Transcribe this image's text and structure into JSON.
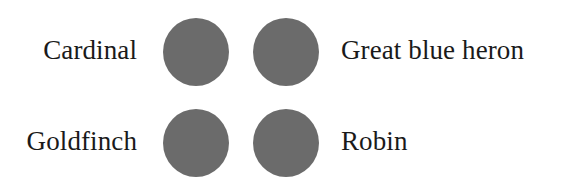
{
  "items": [
    {
      "label": "Cardinal",
      "side": "left",
      "row": 0
    },
    {
      "label": "Great blue heron",
      "side": "right",
      "row": 0
    },
    {
      "label": "Goldfinch",
      "side": "left",
      "row": 1
    },
    {
      "label": "Robin",
      "side": "right",
      "row": 1
    }
  ],
  "dot_color": "#6b6b6b"
}
